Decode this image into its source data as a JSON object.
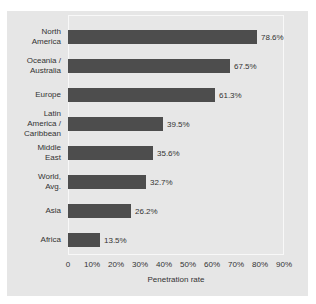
{
  "chart_data": {
    "type": "bar",
    "orientation": "horizontal",
    "title": "",
    "xlabel": "Penetration rate",
    "ylabel": "",
    "categories": [
      "North\nAmerica",
      "Oceania /\nAustralia",
      "Europe",
      "Latin\nAmerica /\nCaribbean",
      "Middle\nEast",
      "World,\nAvg.",
      "Asia",
      "Africa"
    ],
    "values": [
      78.6,
      67.5,
      61.3,
      39.5,
      35.6,
      32.7,
      26.2,
      13.5
    ],
    "value_labels": [
      "78.6%",
      "67.5%",
      "61.3%",
      "39.5%",
      "35.6%",
      "32.7%",
      "26.2%",
      "13.5%"
    ],
    "x_ticks": [
      "0",
      "10%",
      "20%",
      "30%",
      "40%",
      "50%",
      "60%",
      "70%",
      "80%",
      "90%"
    ],
    "xlim": [
      0,
      90
    ],
    "grid": false,
    "legend": "none",
    "colors": {
      "bar": "#4d4d4d",
      "panel_background": "#e6e6e6",
      "plot_background": "#e7e7e7",
      "plot_border": "#f8f8f8",
      "page_background": "#ffffff",
      "text": "#333333"
    }
  }
}
